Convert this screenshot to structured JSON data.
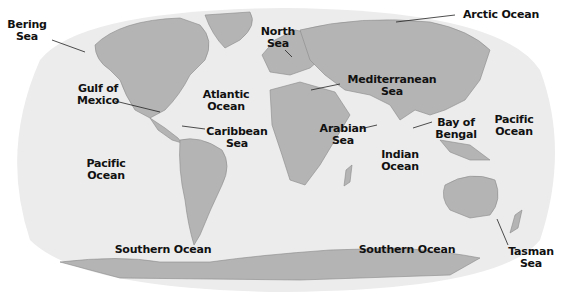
{
  "colors": {
    "ocean": "#ececec",
    "land": "#b4b4b4",
    "coast": "#8a8a8a",
    "background": "#ffffff",
    "text": "#111111"
  },
  "labels": [
    {
      "id": "bering-sea",
      "text": "Bering\nSea",
      "x": 2,
      "y": 19,
      "w": 50
    },
    {
      "id": "arctic-ocean",
      "text": "Arctic Ocean",
      "x": 456,
      "y": 9,
      "w": 90
    },
    {
      "id": "north-sea",
      "text": "North\nSea",
      "x": 258,
      "y": 26,
      "w": 40
    },
    {
      "id": "gulf-of-mexico",
      "text": "Gulf of\nMexico",
      "x": 70,
      "y": 83,
      "w": 56
    },
    {
      "id": "atlantic-ocean",
      "text": "Atlantic\nOcean",
      "x": 196,
      "y": 89,
      "w": 60
    },
    {
      "id": "mediterranean-sea",
      "text": "Mediterranean\nSea",
      "x": 342,
      "y": 74,
      "w": 100
    },
    {
      "id": "caribbean-sea",
      "text": "Caribbean\nSea",
      "x": 202,
      "y": 126,
      "w": 70
    },
    {
      "id": "arabian-sea",
      "text": "Arabian\nSea",
      "x": 315,
      "y": 123,
      "w": 56
    },
    {
      "id": "bay-of-bengal",
      "text": "Bay of\nBengal",
      "x": 432,
      "y": 117,
      "w": 48
    },
    {
      "id": "pacific-ocean-east",
      "text": "Pacific\nOcean",
      "x": 487,
      "y": 114,
      "w": 54
    },
    {
      "id": "indian-ocean",
      "text": "Indian\nOcean",
      "x": 373,
      "y": 149,
      "w": 54
    },
    {
      "id": "pacific-ocean-west",
      "text": "Pacific\nOcean",
      "x": 78,
      "y": 158,
      "w": 56
    },
    {
      "id": "southern-ocean-west",
      "text": "Southern Ocean",
      "x": 108,
      "y": 244,
      "w": 110
    },
    {
      "id": "southern-ocean-east",
      "text": "Southern Ocean",
      "x": 352,
      "y": 244,
      "w": 110
    },
    {
      "id": "tasman-sea",
      "text": "Tasman\nSea",
      "x": 503,
      "y": 246,
      "w": 56
    }
  ]
}
